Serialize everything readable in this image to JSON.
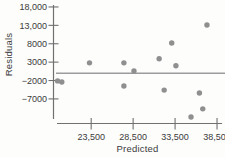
{
  "chart_data": {
    "type": "scatter",
    "title": "",
    "xlabel": "Predicted",
    "ylabel": "Residuals",
    "grid": false,
    "legend": false,
    "xlim": [
      18950,
      39450
    ],
    "ylim": [
      -13550,
      19350
    ],
    "x_ticks": [
      {
        "value": 23500,
        "label": "23,500"
      },
      {
        "value": 28500,
        "label": "28,500"
      },
      {
        "value": 33500,
        "label": "33,500"
      },
      {
        "value": 38500,
        "label": "38,500"
      }
    ],
    "y_ticks": [
      {
        "value": 18000,
        "label": "18,000"
      },
      {
        "value": 13000,
        "label": "13,000"
      },
      {
        "value": 8000,
        "label": "8000"
      },
      {
        "value": 3000,
        "label": "3000"
      },
      {
        "value": -2000,
        "label": "−2000"
      },
      {
        "value": -7000,
        "label": "−7000"
      }
    ],
    "zero_line": 0,
    "points": [
      {
        "x": 19500,
        "y": -2100
      },
      {
        "x": 20000,
        "y": -2400
      },
      {
        "x": 23300,
        "y": 2800
      },
      {
        "x": 27400,
        "y": 2800
      },
      {
        "x": 28600,
        "y": 600
      },
      {
        "x": 27400,
        "y": -3500
      },
      {
        "x": 31600,
        "y": 3900
      },
      {
        "x": 33100,
        "y": 8200
      },
      {
        "x": 33600,
        "y": 2000
      },
      {
        "x": 32200,
        "y": -4600
      },
      {
        "x": 35400,
        "y": -11900
      },
      {
        "x": 36400,
        "y": -5400
      },
      {
        "x": 36800,
        "y": -9700
      },
      {
        "x": 37300,
        "y": 13100
      }
    ],
    "colors": {
      "point": "#8f8f8f",
      "zero_line": "#9c9c9c",
      "axis": "#707070",
      "text": "#3b3b3b",
      "background": "#fdfdfc"
    }
  }
}
